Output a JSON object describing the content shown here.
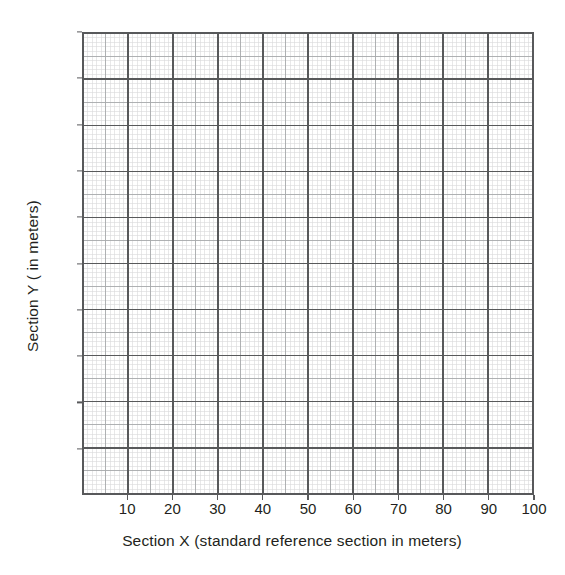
{
  "chart_data": {
    "type": "grid",
    "title": "",
    "subtitle": "",
    "xlabel": "Section X (standard reference section in meters)",
    "ylabel": "Section Y ( in meters)",
    "xlim": [
      0,
      100
    ],
    "ylim": [
      0,
      100
    ],
    "x_ticks": [
      10,
      20,
      30,
      40,
      50,
      60,
      70,
      80,
      90,
      100
    ],
    "y_ticks": [
      10,
      20,
      30,
      40,
      50,
      60,
      70,
      80,
      90,
      100
    ],
    "x_tick_labels": [
      "10",
      "20",
      "30",
      "40",
      "50",
      "60",
      "70",
      "80",
      "90",
      "100"
    ],
    "y_tick_labels": [
      "10",
      "20",
      "30",
      "40",
      "50",
      "60",
      "70",
      "80",
      "90",
      "100"
    ],
    "grid": true,
    "grid_minor_step": 1,
    "grid_medium_step": 5,
    "grid_major_step": 10,
    "legend": null,
    "series": [],
    "values": [],
    "annotations": [],
    "colors": {
      "background": "#ffffff",
      "frame": "#58595b",
      "grid_major": "#58595b",
      "grid_medium": "#a7a9ac",
      "grid_minor": "#d8d9da",
      "text": "#231f20"
    }
  },
  "axes": {
    "x_title": "Section X (standard reference section in meters)",
    "y_title": "Section Y ( in meters)"
  }
}
